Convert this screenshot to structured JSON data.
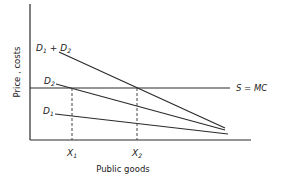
{
  "diagram": {
    "type": "economics-supply-demand",
    "y_axis_label": "Price , costs",
    "x_axis_label": "Public goods",
    "supply_label": "S = MC",
    "curves": [
      {
        "id": "d1_plus_d2",
        "label_main": "D",
        "sub1": "1",
        "plus": "+",
        "label_main2": "D",
        "sub2": "2"
      },
      {
        "id": "d2",
        "label_main": "D",
        "sub": "2"
      },
      {
        "id": "d1",
        "label_main": "D",
        "sub": "1"
      }
    ],
    "x_ticks": [
      {
        "main": "X",
        "sub": "1"
      },
      {
        "main": "X",
        "sub": "2"
      }
    ],
    "colors": {
      "line": "#2a2a2a",
      "dashed": "#444444",
      "text": "#222222"
    }
  }
}
